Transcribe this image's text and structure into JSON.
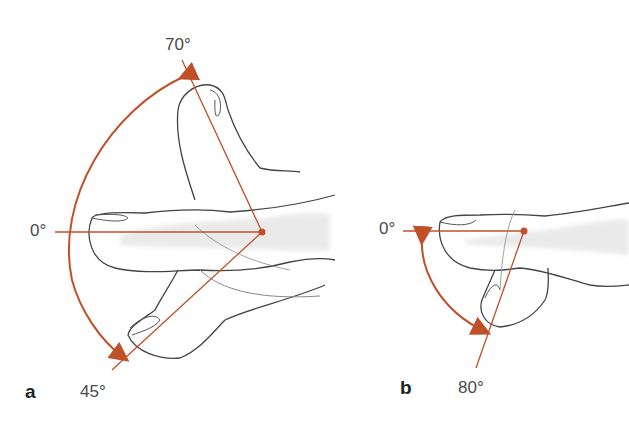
{
  "figure": {
    "panel_a": {
      "label": "a",
      "angles": {
        "neutral": "0°",
        "extension": "70°",
        "flexion": "45°"
      }
    },
    "panel_b": {
      "label": "b",
      "angles": {
        "neutral": "0°",
        "flexion": "80°"
      }
    },
    "colors": {
      "angle_line": "#c0502a",
      "arrow": "#c0502a",
      "outline": "#444444",
      "bone": "#d8d8d8"
    }
  }
}
